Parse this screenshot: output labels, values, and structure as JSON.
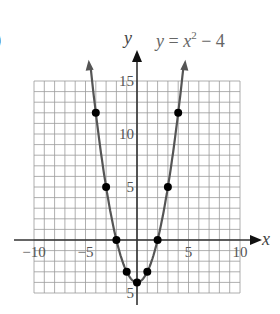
{
  "figure": {
    "part_label": ")",
    "equation": {
      "y": "y",
      "eq": " = ",
      "x": "x",
      "exp": "2",
      "rest": " − 4"
    },
    "x_axis_name": "x",
    "y_axis_name": "y",
    "x_ticks": [
      {
        "v": -10,
        "label": "−10"
      },
      {
        "v": -5,
        "label": "−5"
      },
      {
        "v": 5,
        "label": "5"
      },
      {
        "v": 10,
        "label": "10"
      }
    ],
    "y_ticks": [
      {
        "v": 15,
        "label": "15"
      },
      {
        "v": 10,
        "label": "10"
      },
      {
        "v": 5,
        "label": "5"
      },
      {
        "v": -5,
        "label": "5"
      }
    ]
  },
  "chart_data": {
    "type": "line",
    "xlabel": "x",
    "ylabel": "y",
    "xlim": [
      -10,
      10
    ],
    "ylim": [
      -5,
      15
    ],
    "grid": true,
    "grid_step": 1,
    "series": [
      {
        "name": "y = x^2 − 4",
        "points": [
          [
            -4,
            12
          ],
          [
            -3,
            5
          ],
          [
            -2,
            0
          ],
          [
            -1,
            -3
          ],
          [
            0,
            -4
          ],
          [
            1,
            -3
          ],
          [
            2,
            0
          ],
          [
            3,
            5
          ],
          [
            4,
            12
          ]
        ],
        "curve": "parabola",
        "curve_x_range": [
          -4.5,
          4.5
        ],
        "color": "#555555",
        "marker_color": "#000000"
      }
    ],
    "x_ticks": [
      -10,
      -5,
      5,
      10
    ],
    "y_ticks": [
      15,
      10,
      5,
      -5
    ]
  }
}
